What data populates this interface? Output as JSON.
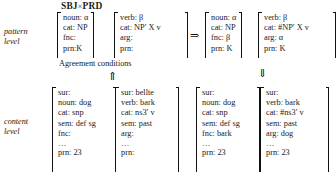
{
  "figure": {
    "title": "SBJ×PRD",
    "title_left": "SBJ",
    "title_times": "×",
    "title_right": "PRD",
    "agreement_label": "Agreement conditions",
    "levels": {
      "pattern": "pattern\nlevel",
      "pattern_line1": "pattern",
      "pattern_line2": "level",
      "content": "content\nlevel",
      "content_line1": "content",
      "content_line2": "level"
    },
    "arrows": {
      "rule_arrow": "⇒",
      "match_arrow_up": "⇑",
      "output_arrow_down": "⇓"
    }
  },
  "matrices": {
    "pattern_in_noun": {
      "name": "pattern-input-noun",
      "rows": [
        "noun: α",
        "cat: NP",
        "fnc:",
        "prn:K"
      ]
    },
    "pattern_in_verb": {
      "name": "pattern-input-verb",
      "rows": [
        "verb: β",
        "cat: NP′ X v",
        "arg:",
        "prn:"
      ]
    },
    "pattern_out_noun": {
      "name": "pattern-output-noun",
      "rows": [
        "noun: α",
        "cat: NP",
        "fnc: β",
        "prn: K"
      ]
    },
    "pattern_out_verb": {
      "name": "pattern-output-verb",
      "rows": [
        "verb: β",
        "cat: #NP′ X v",
        "arg: α",
        "prn: K"
      ]
    },
    "content_in_noun": {
      "name": "content-input-noun",
      "rows": [
        "sur:",
        "noun: dog",
        "cat: snp",
        "sem: def sg",
        "fnc:",
        "…",
        "prn: 23"
      ]
    },
    "content_in_verb": {
      "name": "content-input-verb",
      "rows": [
        "sur: bellte",
        "verb: bark",
        "cat: ns3′ v",
        "sem: past",
        "arg:",
        "…",
        "prn:"
      ]
    },
    "content_out_noun": {
      "name": "content-output-noun",
      "rows": [
        "sur:",
        "noun: dog",
        "cat: snp",
        "sem: def sg",
        "fnc: bark",
        "…",
        "prn: 23"
      ]
    },
    "content_out_verb": {
      "name": "content-output-verb",
      "rows": [
        "sur:",
        "verb: bark",
        "cat: #ns3′ v",
        "sem: past",
        "arg: dog",
        "…",
        "prn: 23"
      ]
    }
  }
}
